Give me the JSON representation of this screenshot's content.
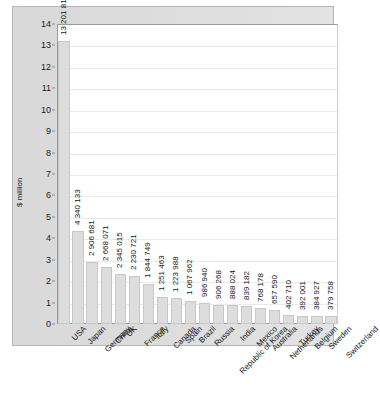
{
  "chart_data": {
    "type": "bar",
    "title": "",
    "xlabel": "",
    "ylabel": "$ million",
    "ylim": [
      0,
      14
    ],
    "y_unit_scale": 1000000,
    "grid": true,
    "legend": "none",
    "y_ticks": [
      "0",
      "1",
      "2",
      "3",
      "4",
      "5",
      "6",
      "7",
      "8",
      "9",
      "10",
      "11",
      "12",
      "13",
      "14"
    ],
    "categories": [
      "USA",
      "Japan",
      "Germany",
      "China",
      "UK",
      "France",
      "Italy",
      "Canada",
      "Spain",
      "Brazil",
      "Russia",
      "Republic of Korea",
      "India",
      "Mexico",
      "Australia",
      "Netherlands",
      "Turkey",
      "Belgium",
      "Sweden",
      "Switzerland"
    ],
    "values": [
      13201819,
      4340133,
      2906681,
      2668071,
      2345015,
      2230721,
      1844749,
      1251463,
      1223988,
      1067962,
      986940,
      906268,
      888024,
      839182,
      768178,
      657590,
      402710,
      392001,
      384927,
      379758
    ],
    "value_labels": [
      "13 201 819",
      "4 340 133",
      "2 906 681",
      "2 668 071",
      "2 345 015",
      "2 230 721",
      "1 844 749",
      "1 251 463",
      "1 223 988",
      "1 067 962",
      "986 940",
      "906 268",
      "888 024",
      "839 182",
      "768 178",
      "657 590",
      "402 710",
      "392 001",
      "384 927",
      "379 758"
    ]
  },
  "colors": {
    "bar_fill": "#dddddd",
    "bar_stroke": "#c8c8c8",
    "plot_background": "#ffffff",
    "panel_background": "#dcdcdc",
    "gridline": "#ebebeb",
    "axis": "#9a9a9a",
    "text": "#141414"
  }
}
